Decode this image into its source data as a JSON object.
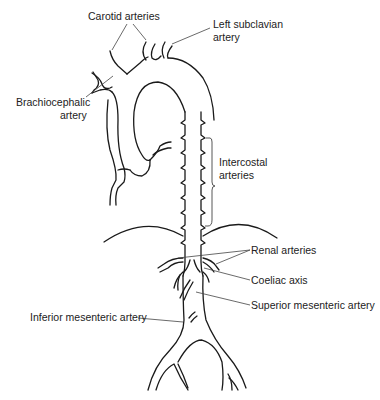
{
  "diagram": {
    "labels": {
      "carotid": "Carotid arteries",
      "left_subclavian_1": "Left subclavian",
      "left_subclavian_2": "artery",
      "brachiocephalic_1": "Brachiocephalic",
      "brachiocephalic_2": "artery",
      "intercostal_1": "Intercostal",
      "intercostal_2": "arteries",
      "renal": "Renal arteries",
      "coeliac": "Coeliac axis",
      "superior_mesenteric": "Superior mesenteric artery",
      "inferior_mesenteric": "Inferior mesenteric artery"
    }
  }
}
